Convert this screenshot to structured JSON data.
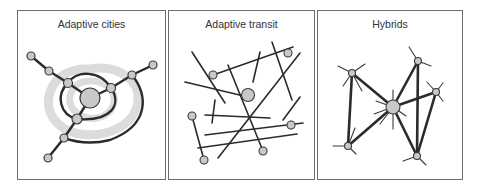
{
  "panels": [
    {
      "id": "adaptive-cities",
      "title": "Adaptive cities"
    },
    {
      "id": "adaptive-transit",
      "title": "Adaptive transit"
    },
    {
      "id": "hybrids",
      "title": "Hybrids"
    }
  ],
  "colors": {
    "border": "#6e6e6e",
    "line": "#2b2b2b",
    "node_fill": "#c8c8c8",
    "node_stroke": "#3a3a3a",
    "halo": "#dcdcdc",
    "title": "#333333"
  }
}
